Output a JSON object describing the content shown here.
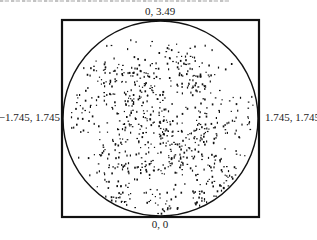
{
  "header": {
    "clipped_caption_visible": true
  },
  "chart_data": {
    "type": "scatter",
    "title": "",
    "xlabel": "",
    "ylabel": "",
    "xlim": [
      -1.745,
      1.745
    ],
    "ylim": [
      0,
      3.49
    ],
    "grid": false,
    "legend": null,
    "boundary": {
      "shape": "circle",
      "center": [
        0,
        1.745
      ],
      "radius": 1.745
    },
    "frame": {
      "shape": "square",
      "x": [
        -1.745,
        1.745
      ],
      "y": [
        0,
        3.49
      ]
    },
    "annotations": {
      "top": "0, 3.49",
      "bottom": "0, 0",
      "left": "−1.745, 1.745",
      "right": "1.745, 1.745"
    },
    "point_clusters": [
      {
        "x": -0.95,
        "y": 2.55,
        "spread": 0.18,
        "n": 40
      },
      {
        "x": -0.35,
        "y": 2.35,
        "spread": 0.2,
        "n": 45
      },
      {
        "x": 0.35,
        "y": 2.75,
        "spread": 0.22,
        "n": 35
      },
      {
        "x": 0.65,
        "y": 2.35,
        "spread": 0.18,
        "n": 40
      },
      {
        "x": -1.3,
        "y": 1.95,
        "spread": 0.2,
        "n": 30
      },
      {
        "x": -0.55,
        "y": 1.75,
        "spread": 0.22,
        "n": 45
      },
      {
        "x": 0.05,
        "y": 1.55,
        "spread": 0.15,
        "n": 30
      },
      {
        "x": 0.75,
        "y": 1.45,
        "spread": 0.16,
        "n": 45
      },
      {
        "x": 1.3,
        "y": 1.7,
        "spread": 0.18,
        "n": 25
      },
      {
        "x": -0.95,
        "y": 1.05,
        "spread": 0.22,
        "n": 40
      },
      {
        "x": -0.3,
        "y": 0.9,
        "spread": 0.18,
        "n": 35
      },
      {
        "x": 0.3,
        "y": 1.1,
        "spread": 0.2,
        "n": 40
      },
      {
        "x": 0.85,
        "y": 0.85,
        "spread": 0.2,
        "n": 40
      },
      {
        "x": 1.2,
        "y": 0.55,
        "spread": 0.15,
        "n": 30
      },
      {
        "x": -0.75,
        "y": 0.3,
        "spread": 0.15,
        "n": 35
      },
      {
        "x": 0.1,
        "y": 0.2,
        "spread": 0.18,
        "n": 35
      },
      {
        "x": 0.7,
        "y": 0.3,
        "spread": 0.15,
        "n": 30
      },
      {
        "x": 0.0,
        "y": 1.75,
        "spread": 1.3,
        "n": 260
      }
    ],
    "point_color": "#111111",
    "frame_color": "#111111"
  }
}
